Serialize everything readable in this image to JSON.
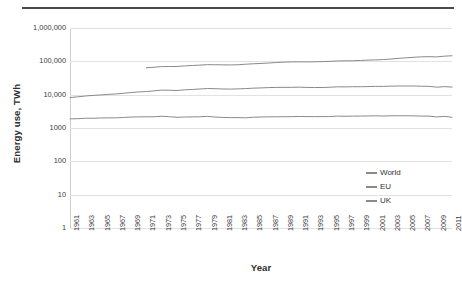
{
  "chart_data": {
    "type": "line",
    "title": "",
    "xlabel": "Year",
    "ylabel": "Energy use, TWh",
    "yscale": "log",
    "ylim": [
      1,
      1000000
    ],
    "ytick_labels": [
      "1,000,000",
      "100,000",
      "10,000",
      "1000",
      "100",
      "10",
      "1"
    ],
    "ytick_values": [
      1000000,
      100000,
      10000,
      1000,
      100,
      10,
      1
    ],
    "xlim": [
      1961,
      2011
    ],
    "grid": true,
    "legend_position": "center-right",
    "x": [
      1961,
      1962,
      1963,
      1964,
      1965,
      1966,
      1967,
      1968,
      1969,
      1970,
      1971,
      1972,
      1973,
      1974,
      1975,
      1976,
      1977,
      1978,
      1979,
      1980,
      1981,
      1982,
      1983,
      1984,
      1985,
      1986,
      1987,
      1988,
      1989,
      1990,
      1991,
      1992,
      1993,
      1994,
      1995,
      1996,
      1997,
      1998,
      1999,
      2000,
      2001,
      2002,
      2003,
      2004,
      2005,
      2006,
      2007,
      2008,
      2009,
      2010,
      2011
    ],
    "series": [
      {
        "name": "World",
        "color": "#8a8a8a",
        "values": [
          null,
          null,
          null,
          null,
          null,
          null,
          null,
          null,
          null,
          null,
          64000,
          66500,
          69500,
          69800,
          70000,
          73000,
          75000,
          77000,
          79500,
          79000,
          78500,
          78000,
          79000,
          82000,
          84500,
          86500,
          89000,
          92000,
          94500,
          96000,
          96500,
          96000,
          97000,
          98000,
          100000,
          102500,
          103500,
          104000,
          106000,
          109000,
          110500,
          113000,
          117500,
          123000,
          127500,
          132000,
          136500,
          138000,
          136000,
          143000,
          147000
        ]
      },
      {
        "name": "EU",
        "color": "#8a8a8a",
        "values": [
          8200,
          8600,
          9100,
          9500,
          9800,
          10200,
          10500,
          11000,
          11600,
          12100,
          12400,
          13000,
          13700,
          13600,
          13300,
          14000,
          14300,
          14800,
          15300,
          15100,
          14800,
          14700,
          14900,
          15200,
          15700,
          15900,
          16300,
          16500,
          16600,
          16600,
          16800,
          16500,
          16400,
          16400,
          16700,
          17200,
          17100,
          17300,
          17300,
          17500,
          17700,
          17700,
          18000,
          18200,
          18200,
          18200,
          17900,
          17800,
          16800,
          17400,
          16900
        ]
      },
      {
        "name": "UK",
        "color": "#8a8a8a",
        "values": [
          1880,
          1900,
          1960,
          1960,
          2000,
          2010,
          2020,
          2070,
          2130,
          2160,
          2160,
          2170,
          2250,
          2180,
          2100,
          2130,
          2150,
          2170,
          2230,
          2130,
          2080,
          2050,
          2050,
          2020,
          2110,
          2140,
          2160,
          2170,
          2180,
          2190,
          2220,
          2200,
          2190,
          2200,
          2200,
          2280,
          2250,
          2270,
          2280,
          2300,
          2320,
          2290,
          2320,
          2330,
          2330,
          2310,
          2280,
          2270,
          2150,
          2230,
          2100
        ]
      }
    ]
  },
  "legend": {
    "items": [
      {
        "label": "World",
        "color": "#8a8a8a"
      },
      {
        "label": "EU",
        "color": "#8a8a8a"
      },
      {
        "label": "UK",
        "color": "#8a8a8a"
      }
    ]
  },
  "axis": {
    "x_title": "Year",
    "y_title": "Energy use, TWh",
    "x_ticks": [
      "1961",
      "1963",
      "1965",
      "1967",
      "1969",
      "1971",
      "1973",
      "1975",
      "1977",
      "1979",
      "1981",
      "1983",
      "1985",
      "1987",
      "1989",
      "1991",
      "1993",
      "1995",
      "1997",
      "1999",
      "2001",
      "2003",
      "2005",
      "2007",
      "2009",
      "2011"
    ],
    "y_ticks": [
      "1,000,000",
      "100,000",
      "10,000",
      "1000",
      "100",
      "10",
      "1"
    ]
  },
  "colors": {
    "gridline": "#e2e2e2",
    "axis": "#bdbdbd",
    "text": "#404040",
    "rule": "#4a4a4a",
    "series": "#8a8a8a"
  }
}
